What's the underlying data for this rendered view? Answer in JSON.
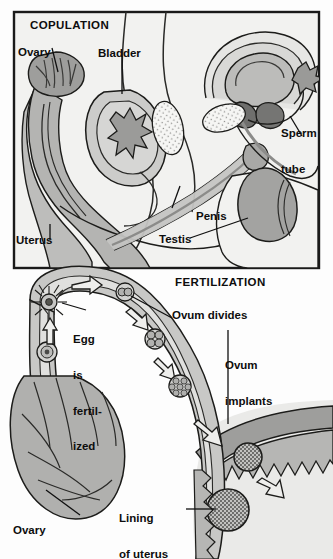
{
  "figure": {
    "panels": [
      {
        "id": "copulation",
        "heading": "COPULATION",
        "labels": [
          {
            "name": "ovary",
            "text": "Ovary"
          },
          {
            "name": "bladder",
            "text": "Bladder"
          },
          {
            "name": "sperm-tube",
            "line1": "Sperm",
            "line2": "tube"
          },
          {
            "name": "penis",
            "text": "Penis"
          },
          {
            "name": "testis",
            "text": "Testis"
          },
          {
            "name": "uterus",
            "text": "Uterus"
          }
        ]
      },
      {
        "id": "fertilization",
        "heading": "FERTILIZATION",
        "labels": [
          {
            "name": "egg-is-fertilized",
            "line1": "Egg",
            "line2": "is",
            "line3": "fertil-",
            "line4": "ized"
          },
          {
            "name": "ovum-divides",
            "text": "Ovum divides"
          },
          {
            "name": "ovum-implants",
            "line1": "Ovum",
            "line2": "implants"
          },
          {
            "name": "lining-of-uterus",
            "line1": "Lining",
            "line2": "of uterus"
          },
          {
            "name": "ovary-lower",
            "text": "Ovary"
          }
        ]
      }
    ],
    "stages": [
      {
        "name": "ovum-unfertilized",
        "description": "ovum in ovary"
      },
      {
        "name": "egg-fertilized",
        "description": "egg surrounded by sperm"
      },
      {
        "name": "two-cell",
        "description": "ovum divides, two cells"
      },
      {
        "name": "four-cell",
        "description": "four cell stage"
      },
      {
        "name": "morula",
        "description": "many celled morula"
      },
      {
        "name": "blastocyst",
        "description": "ovum implanting in lining"
      },
      {
        "name": "implanted-embryo",
        "description": "embryo implanted in uterus lining"
      }
    ],
    "colors": {
      "ink": "#101010",
      "frame": "#1a1a1a",
      "paper": "#f2f2f0",
      "page": "#fdfdfd",
      "tone_light": "#e2e2e0",
      "tone_mid": "#c8c8c6",
      "tone_dark": "#a9a9a7",
      "tone_deep": "#8a8a88",
      "tone_stipple": "#f6f6f4"
    }
  }
}
